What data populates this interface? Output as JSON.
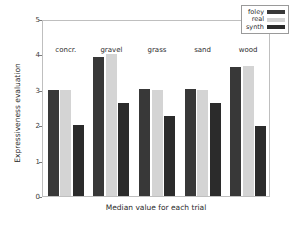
{
  "chart_data": {
    "type": "bar",
    "title": "",
    "xlabel": "Median value for each trial",
    "ylabel": "Expressiveness evaluation",
    "categories": [
      "concr.",
      "gravel",
      "grass",
      "sand",
      "wood"
    ],
    "series": [
      {
        "name": "foley",
        "color": "#383838",
        "values": [
          3.0,
          3.93,
          3.02,
          3.02,
          3.65
        ]
      },
      {
        "name": "real",
        "color": "#d4d4d4",
        "values": [
          3.0,
          4.0,
          3.0,
          3.0,
          3.68
        ]
      },
      {
        "name": "synth",
        "color": "#2b2b2b",
        "values": [
          2.0,
          2.63,
          2.27,
          2.64,
          1.99
        ]
      }
    ],
    "ylim": [
      0,
      5
    ],
    "yticks": [
      0,
      1,
      2,
      3,
      4,
      5
    ],
    "ytick_labels": [
      "0",
      "1",
      "2",
      "3",
      "4",
      "5"
    ],
    "grid": false,
    "legend_position": "upper right"
  },
  "legend": {
    "entries": [
      {
        "label": "foley",
        "color": "#383838"
      },
      {
        "label": "real",
        "color": "#d4d4d4"
      },
      {
        "label": "synth",
        "color": "#2b2b2b"
      }
    ]
  },
  "axes": {
    "frame_color": "#bfbfbf",
    "tick_color": "#7a7a7a",
    "text_color": "#2b2b2b"
  }
}
